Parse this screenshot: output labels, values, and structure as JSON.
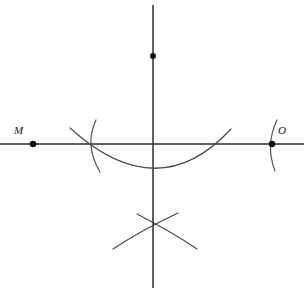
{
  "figure": {
    "background_color": "#ffffff",
    "width": 304,
    "height": 292,
    "line_color": "#2b2b2b",
    "arc_color": "#4a4a4a",
    "point_color": "#111111"
  },
  "labels": {
    "left_point": "M",
    "right_point": "O"
  },
  "points": [
    {
      "name": "M",
      "label": "M",
      "x": 33,
      "y": 144
    },
    {
      "name": "O",
      "label": "O",
      "x": 272,
      "y": 144
    },
    {
      "name": "upper-vertical-point",
      "label": "",
      "x": 153,
      "y": 56
    }
  ],
  "lines": [
    {
      "name": "horizontal-axis",
      "x1": 0,
      "y1": 144,
      "x2": 304,
      "y2": 144
    },
    {
      "name": "vertical-axis",
      "x1": 153,
      "y1": 5,
      "x2": 153,
      "y2": 288
    }
  ],
  "arcs": [
    {
      "name": "arc-through-m",
      "path": "M 96 120 Q 84 145 100 172"
    },
    {
      "name": "arc-through-o",
      "path": "M 277 120 Q 265 145 275 171"
    },
    {
      "name": "large-lower-arc",
      "path": "M 70 128 Q 158 208 231 129"
    },
    {
      "name": "lower-cross-arc-left",
      "path": "M 137 214 Q 140 230 113 249"
    },
    {
      "name": "lower-cross-arc-right",
      "path": "M 178 213 Q 174 231 197 249"
    },
    {
      "name": "lower-cross-arc-left-tail",
      "path": "M 113 249 Q 140 231 178 213"
    },
    {
      "name": "lower-cross-arc-right-tail",
      "path": "M 197 249 Q 172 232 137 214"
    }
  ],
  "label_positions": {
    "left_point_label": {
      "x": 14,
      "y": 134
    },
    "right_point_label": {
      "x": 278,
      "y": 134
    }
  }
}
